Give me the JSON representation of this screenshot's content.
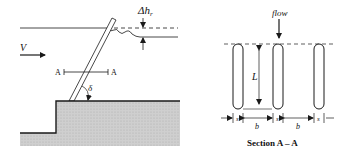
{
  "left_view": {
    "velocity_label": "V",
    "head_loss_label": "Δh",
    "head_loss_subscript": "r",
    "section_marker_left": "A",
    "section_marker_right": "A",
    "angle_label": "δ"
  },
  "right_view": {
    "flow_label": "flow",
    "length_label": "L",
    "spacing_labels": [
      "s",
      "b",
      "s",
      "b",
      "s"
    ],
    "caption": "Section A – A"
  },
  "colors": {
    "line": "#1a1a1a",
    "ground_fill": "#c9c9c9"
  }
}
